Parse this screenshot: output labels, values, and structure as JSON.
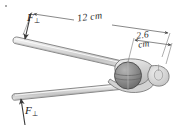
{
  "figure": {
    "name": "pliers-gripping-nut-force-diagram",
    "background_color": "#ffffff",
    "labels": {
      "force_top": {
        "symbol": "F",
        "subscript": "⊥"
      },
      "force_bottom": {
        "symbol": "F",
        "subscript": "⊥"
      }
    },
    "dimensions": {
      "handle_length": "12 cm",
      "jaw_width_value": "2.6",
      "jaw_width_unit": "cm"
    },
    "colors": {
      "tool_fill": "#d8d8d8",
      "tool_fill_light": "#ededed",
      "tool_outline": "#6f6f6f",
      "nut_fill": "#8f8f8f",
      "nut_outline": "#4a4a4a",
      "dimension_line": "#555555",
      "arrow": "#3a3a3a"
    }
  }
}
